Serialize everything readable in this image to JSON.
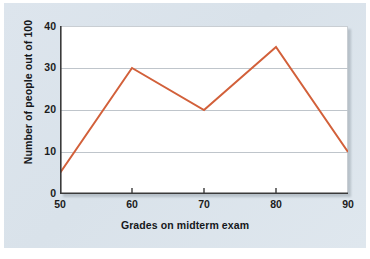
{
  "chart_data": {
    "type": "line",
    "title": "",
    "xlabel": "Grades on midterm exam",
    "ylabel": "Number of people out of 100",
    "x": [
      50,
      60,
      70,
      80,
      90
    ],
    "values": [
      5,
      30,
      20,
      35,
      10
    ],
    "series": [
      {
        "name": "Number of people out of 100",
        "x": [
          50,
          60,
          70,
          80,
          90
        ],
        "values": [
          5,
          30,
          20,
          35,
          10
        ],
        "color": "#d2603a"
      }
    ],
    "xticks": [
      "50",
      "60",
      "70",
      "80",
      "90"
    ],
    "yticks": [
      "0",
      "10",
      "20",
      "30",
      "40"
    ],
    "xlim": [
      50,
      90
    ],
    "ylim": [
      0,
      40
    ],
    "grid": "horizontal",
    "legend": "none",
    "gridline_color": "#bfc5cb",
    "axis_color": "#3a3a3a",
    "plot_background": "#ffffff",
    "figure_background": "#dce5ed"
  }
}
